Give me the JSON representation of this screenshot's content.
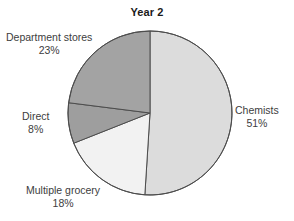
{
  "chart_data": {
    "type": "pie",
    "title": "Year 2",
    "xlabel": "",
    "ylabel": "",
    "legend_position": "none",
    "grid": false,
    "start_angle_deg": 0,
    "direction": "clockwise",
    "categories": [
      "Chemists",
      "Multiple grocery",
      "Direct",
      "Department stores"
    ],
    "values": [
      51,
      18,
      8,
      23
    ],
    "value_unit": "%",
    "labels": [
      "51%",
      "18%",
      "8%",
      "23%"
    ],
    "colors": [
      "#dcdcdc",
      "#f2f2f2",
      "#9e9e9e",
      "#a3a3a3"
    ],
    "slices": [
      {
        "name": "Chemists",
        "value": 51,
        "label": "51%",
        "color": "#dcdcdc"
      },
      {
        "name": "Multiple grocery",
        "value": 18,
        "label": "18%",
        "color": "#f2f2f2"
      },
      {
        "name": "Direct",
        "value": 8,
        "label": "8%",
        "color": "#9e9e9e"
      },
      {
        "name": "Department stores",
        "value": 23,
        "label": "23%",
        "color": "#a3a3a3"
      }
    ]
  },
  "figure": {
    "title": "Year 2",
    "background": "#ffffff",
    "outline_color": "#4d4d4d"
  },
  "annotations": {
    "department_stores": {
      "name": "Department stores",
      "percent": "23%"
    },
    "chemists": {
      "name": "Chemists",
      "percent": "51%"
    },
    "direct": {
      "name": "Direct",
      "percent": "8%"
    },
    "multiple_grocery": {
      "name": "Multiple grocery",
      "percent": "18%"
    }
  }
}
